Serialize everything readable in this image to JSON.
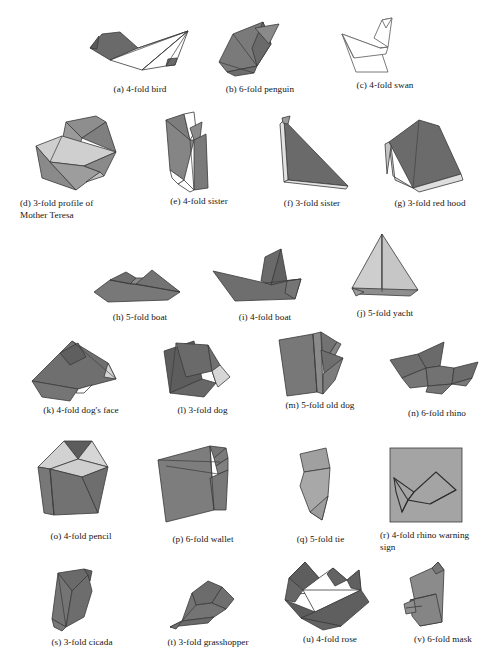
{
  "plate": {
    "kind": "origami-figure-plate",
    "background_color": "#ffffff",
    "total_figures": 22,
    "palette": {
      "dark_gray": "#6e6e6e",
      "darker_gray": "#5f5f5f",
      "mid_gray": "#8a8a8a",
      "light_gray": "#c8c8c8",
      "pale_gray": "#dcdcdc",
      "white": "#ffffff",
      "stroke": "#3a3a3a",
      "text": "#141414"
    }
  },
  "rows": [
    {
      "index": 1,
      "figures": [
        "a",
        "b",
        "c"
      ]
    },
    {
      "index": 2,
      "figures": [
        "d",
        "e",
        "f",
        "g"
      ]
    },
    {
      "index": 3,
      "figures": [
        "h",
        "i",
        "j"
      ]
    },
    {
      "index": 4,
      "figures": [
        "k",
        "l",
        "m",
        "n"
      ]
    },
    {
      "index": 5,
      "figures": [
        "o",
        "p",
        "q",
        "r"
      ]
    },
    {
      "index": 6,
      "figures": [
        "s",
        "t",
        "u",
        "v"
      ]
    }
  ],
  "figures": {
    "a": {
      "letter": "(a)",
      "folds": "4-fold",
      "subject": "bird",
      "caption": "(a) 4-fold bird"
    },
    "b": {
      "letter": "(b)",
      "folds": "6-fold",
      "subject": "penguin",
      "caption": "(b) 6-fold penguin"
    },
    "c": {
      "letter": "(c)",
      "folds": "4-fold",
      "subject": "swan",
      "caption": "(c) 4-fold swan"
    },
    "d": {
      "letter": "(d)",
      "folds": "3-fold",
      "subject": "profile of Mother Teresa",
      "caption": "(d)  3-fold  profile  of Mother Teresa",
      "caption_line1": "(d) 3-fold profile of",
      "caption_line2": "Mother Teresa"
    },
    "e": {
      "letter": "(e)",
      "folds": "4-fold",
      "subject": "sister",
      "caption": "(e) 4-fold sister"
    },
    "f": {
      "letter": "(f)",
      "folds": "3-fold",
      "subject": "sister",
      "caption": "(f) 3-fold sister"
    },
    "g": {
      "letter": "(g)",
      "folds": "3-fold",
      "subject": "red hood",
      "caption": "(g) 3-fold red hood"
    },
    "h": {
      "letter": "(h)",
      "folds": "5-fold",
      "subject": "boat",
      "caption": "(h) 5-fold boat"
    },
    "i": {
      "letter": "(i)",
      "folds": "4-fold",
      "subject": "boat",
      "caption": "(i) 4-fold boat"
    },
    "j": {
      "letter": "(j)",
      "folds": "5-fold",
      "subject": "yacht",
      "caption": "(j) 5-fold yacht"
    },
    "k": {
      "letter": "(k)",
      "folds": "4-fold",
      "subject": "dog's face",
      "caption": "(k) 4-fold dog's face"
    },
    "l": {
      "letter": "(l)",
      "folds": "3-fold",
      "subject": "dog",
      "caption": "(l) 3-fold dog"
    },
    "m": {
      "letter": "(m)",
      "folds": "5-fold",
      "subject": "old dog",
      "caption": "(m) 5-fold old dog"
    },
    "n": {
      "letter": "(n)",
      "folds": "6-fold",
      "subject": "rhino",
      "caption": "(n) 6-fold rhino"
    },
    "o": {
      "letter": "(o)",
      "folds": "4-fold",
      "subject": "pencil",
      "caption": "(o) 4-fold pencil"
    },
    "p": {
      "letter": "(p)",
      "folds": "6-fold",
      "subject": "wallet",
      "caption": "(p) 6-fold wallet"
    },
    "q": {
      "letter": "(q)",
      "folds": "5-fold",
      "subject": "tie",
      "caption": "(q) 5-fold tie"
    },
    "r": {
      "letter": "(r)",
      "folds": "4-fold",
      "subject": "rhino warning sign",
      "caption": "(r)  4-fold  rhino  warning sign",
      "caption_line1": "(r) 4-fold rhino warning",
      "caption_line2": "sign"
    },
    "s": {
      "letter": "(s)",
      "folds": "3-fold",
      "subject": "cicada",
      "caption": "(s) 3-fold cicada"
    },
    "t": {
      "letter": "(t)",
      "folds": "3-fold",
      "subject": "grasshopper",
      "caption": "(t) 3-fold grasshopper"
    },
    "u": {
      "letter": "(u)",
      "folds": "4-fold",
      "subject": "rose",
      "caption": "(u) 4-fold rose"
    },
    "v": {
      "letter": "(v)",
      "folds": "6-fold",
      "subject": "mask",
      "caption": "(v) 6-fold mask"
    }
  }
}
